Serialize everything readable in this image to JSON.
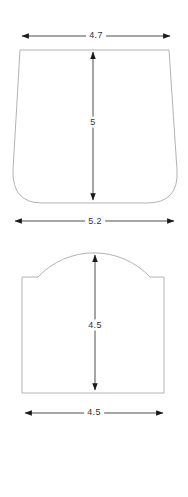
{
  "diagram": {
    "colors": {
      "background": "#ffffff",
      "shape_outline": "#b3b3b3",
      "dimension_line": "#4d4d4d",
      "arrowhead": "#1a1a1a",
      "label_text": "#333333"
    },
    "figures": [
      {
        "id": "tapered-vessel",
        "description": "trapezoidal outline, narrower at top, rounded bottom corners",
        "dims": {
          "top_width": "4.7",
          "height": "5",
          "bottom_width": "5.2"
        }
      },
      {
        "id": "arched-panel",
        "description": "rectangle with arched dome top and small shoulders",
        "dims": {
          "height": "4.5",
          "bottom_width": "4.5"
        }
      }
    ]
  }
}
